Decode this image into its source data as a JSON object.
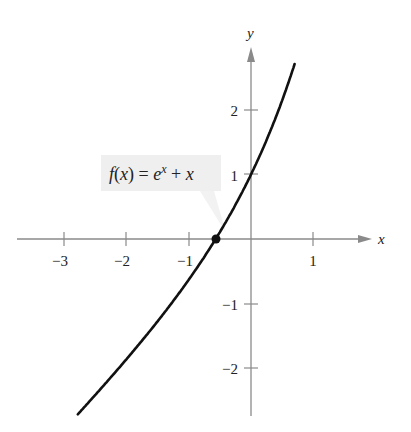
{
  "chart_data": {
    "type": "line",
    "title": "",
    "xlabel": "x",
    "ylabel": "y",
    "xlim": [
      -3.8,
      1.55
    ],
    "ylim": [
      -2.5,
      2.85
    ],
    "x_ticks": [
      -3,
      -2,
      -1,
      1
    ],
    "x_tick_labels": [
      "−3",
      "−2",
      "−1",
      "1"
    ],
    "y_ticks": [
      -2,
      -1,
      1,
      2
    ],
    "y_tick_labels": [
      "−2",
      "−1",
      "1",
      "2"
    ],
    "grid": false,
    "series": [
      {
        "name": "f(x) = e^x + x",
        "x": [
          -2.8,
          -2.5,
          -2.0,
          -1.5,
          -1.0,
          -0.567,
          -0.5,
          0.0,
          0.25,
          0.5,
          0.7
        ],
        "values": [
          -2.74,
          -2.42,
          -1.86,
          -1.28,
          -0.63,
          0.0,
          0.11,
          1.0,
          1.53,
          2.15,
          2.71
        ]
      }
    ],
    "annotations": [
      {
        "text": "f(x) = e^x + x",
        "points_to": [
          -0.567,
          0
        ]
      },
      {
        "type": "point",
        "x": -0.567,
        "y": 0
      }
    ]
  },
  "labels": {
    "x_axis": "x",
    "y_axis": "y",
    "tick_x": [
      "−3",
      "−2",
      "−1",
      "1"
    ],
    "tick_y": [
      "2",
      "1",
      "−1",
      "−2"
    ],
    "function_f": "f",
    "function_paren_open": "(",
    "function_x": "x",
    "function_rest": ") = ",
    "function_e": "e",
    "function_exp": "x",
    "function_plus": " + ",
    "function_x2": "x"
  },
  "colors": {
    "axis": "#8a8a8a",
    "curve": "#111111",
    "label_box": "#efefef"
  }
}
